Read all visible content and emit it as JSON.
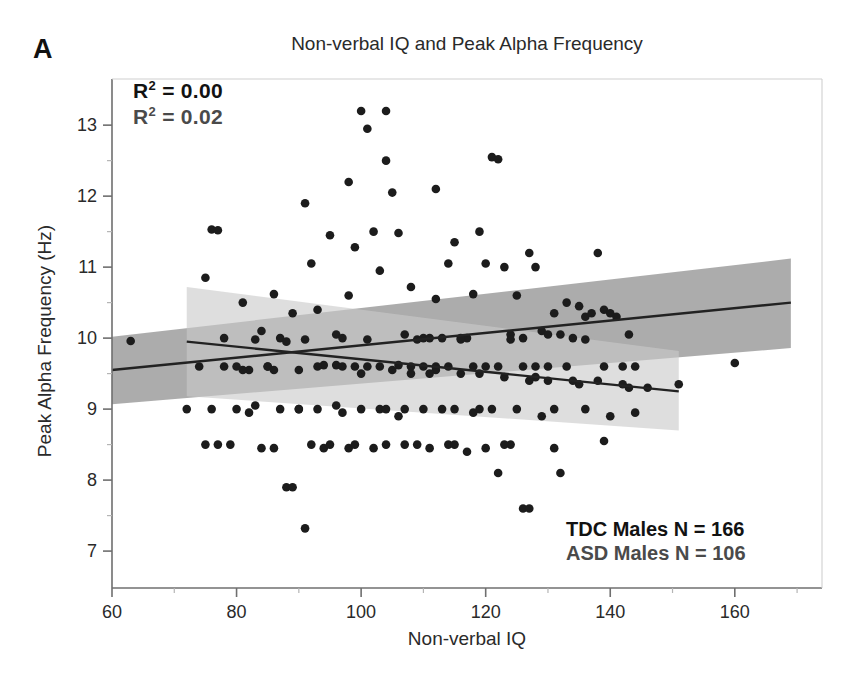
{
  "figure": {
    "panel_letter": "A",
    "title": "Non-verbal IQ and Peak Alpha Frequency",
    "xlabel": "Non-verbal IQ",
    "ylabel": "Peak Alpha Frequency (Hz)"
  },
  "annotations": {
    "r2_tdc_label": "R",
    "r2_tdc_value": " = 0.00",
    "r2_asd_label": "R",
    "r2_asd_value": " = 0.02",
    "r2_sup": "2",
    "n_tdc": "TDC Males N = 166",
    "n_asd": "ASD Males N = 106"
  },
  "colors": {
    "point": "#1c1c1c",
    "line": "#222222",
    "band_tdc": "#a8a8a8",
    "band_asd": "#c9c9c9",
    "axis": "#8a8a8a",
    "text": "#2a2a2a"
  },
  "chart_data": {
    "type": "scatter",
    "title": "Non-verbal IQ and Peak Alpha Frequency",
    "xlabel": "Non-verbal IQ",
    "ylabel": "Peak Alpha Frequency (Hz)",
    "xlim": [
      60,
      174
    ],
    "ylim": [
      6.48,
      13.65
    ],
    "xticks": [
      60,
      80,
      100,
      120,
      140,
      160
    ],
    "yticks": [
      7,
      8,
      9,
      10,
      11,
      12,
      13
    ],
    "yminorticks": [
      7.5,
      8.5,
      9.5,
      10.5,
      11.5,
      12.5
    ],
    "grid": false,
    "legend_position": "bottom-right",
    "series": [
      {
        "name": "TDC Males",
        "n": 166,
        "r_squared": 0.0,
        "fit": {
          "x0": 60,
          "y0": 9.55,
          "x1": 169,
          "y1": 10.5
        },
        "band": {
          "x0": 60,
          "x1": 169,
          "lo0": 9.07,
          "hi0": 10.02,
          "lo1": 9.86,
          "hi1": 11.12
        }
      },
      {
        "name": "ASD Males",
        "n": 106,
        "r_squared": 0.02,
        "fit": {
          "x0": 72,
          "y0": 9.95,
          "x1": 151,
          "y1": 9.25
        },
        "band": {
          "x0": 72,
          "x1": 151,
          "lo0": 9.18,
          "hi0": 10.72,
          "lo1": 8.7,
          "hi1": 9.82
        }
      }
    ],
    "points_tdc": [
      [
        63,
        9.96
      ],
      [
        76,
        11.53
      ],
      [
        77,
        11.52
      ],
      [
        75,
        10.85
      ],
      [
        78,
        10.0
      ],
      [
        81,
        10.5
      ],
      [
        84,
        10.1
      ],
      [
        86,
        10.62
      ],
      [
        87,
        10.0
      ],
      [
        88,
        9.95
      ],
      [
        89,
        10.35
      ],
      [
        90,
        9.0
      ],
      [
        91,
        11.9
      ],
      [
        92,
        11.05
      ],
      [
        93,
        10.4
      ],
      [
        94,
        9.62
      ],
      [
        95,
        11.45
      ],
      [
        96,
        10.05
      ],
      [
        97,
        10.0
      ],
      [
        98,
        10.6
      ],
      [
        99,
        11.28
      ],
      [
        100,
        13.2
      ],
      [
        101,
        12.95
      ],
      [
        102,
        11.5
      ],
      [
        103,
        10.95
      ],
      [
        104,
        13.2
      ],
      [
        105,
        12.05
      ],
      [
        106,
        11.48
      ],
      [
        107,
        10.05
      ],
      [
        108,
        10.72
      ],
      [
        109,
        9.98
      ],
      [
        110,
        10.0
      ],
      [
        111,
        10.0
      ],
      [
        112,
        10.55
      ],
      [
        113,
        10.0
      ],
      [
        114,
        11.05
      ],
      [
        115,
        11.35
      ],
      [
        116,
        10.0
      ],
      [
        117,
        10.0
      ],
      [
        118,
        10.62
      ],
      [
        119,
        11.5
      ],
      [
        120,
        11.05
      ],
      [
        121,
        12.55
      ],
      [
        122,
        12.52
      ],
      [
        123,
        11.0
      ],
      [
        124,
        10.05
      ],
      [
        125,
        10.6
      ],
      [
        126,
        10.0
      ],
      [
        127,
        11.2
      ],
      [
        128,
        11.0
      ],
      [
        129,
        10.1
      ],
      [
        130,
        10.05
      ],
      [
        131,
        10.35
      ],
      [
        132,
        10.05
      ],
      [
        133,
        10.5
      ],
      [
        134,
        10.0
      ],
      [
        135,
        10.45
      ],
      [
        136,
        10.3
      ],
      [
        137,
        10.35
      ],
      [
        138,
        11.2
      ],
      [
        139,
        10.4
      ],
      [
        140,
        10.35
      ],
      [
        141,
        10.3
      ],
      [
        143,
        10.05
      ],
      [
        144,
        9.6
      ],
      [
        160,
        9.65
      ],
      [
        80,
        9.6
      ],
      [
        82,
        9.55
      ],
      [
        83,
        9.98
      ],
      [
        85,
        9.6
      ],
      [
        91,
        9.98
      ],
      [
        96,
        9.62
      ],
      [
        99,
        9.6
      ],
      [
        101,
        9.98
      ],
      [
        103,
        9.6
      ],
      [
        106,
        9.62
      ],
      [
        108,
        9.6
      ],
      [
        110,
        9.6
      ],
      [
        112,
        9.6
      ],
      [
        114,
        9.6
      ],
      [
        116,
        9.98
      ],
      [
        118,
        9.6
      ],
      [
        120,
        9.6
      ],
      [
        122,
        9.6
      ],
      [
        124,
        9.98
      ],
      [
        126,
        9.6
      ],
      [
        128,
        9.6
      ],
      [
        130,
        9.6
      ],
      [
        133,
        9.6
      ],
      [
        136,
        9.98
      ],
      [
        139,
        9.6
      ],
      [
        142,
        9.6
      ],
      [
        98,
        12.2
      ],
      [
        104,
        12.5
      ],
      [
        112,
        12.1
      ]
    ],
    "points_asd": [
      [
        72,
        9.0
      ],
      [
        75,
        8.5
      ],
      [
        77,
        8.5
      ],
      [
        78,
        9.6
      ],
      [
        80,
        9.0
      ],
      [
        82,
        8.95
      ],
      [
        83,
        9.05
      ],
      [
        84,
        8.45
      ],
      [
        85,
        9.6
      ],
      [
        86,
        8.45
      ],
      [
        87,
        9.0
      ],
      [
        88,
        7.9
      ],
      [
        89,
        7.9
      ],
      [
        90,
        9.0
      ],
      [
        91,
        7.32
      ],
      [
        92,
        8.5
      ],
      [
        93,
        9.0
      ],
      [
        94,
        8.45
      ],
      [
        95,
        8.5
      ],
      [
        96,
        9.05
      ],
      [
        97,
        9.6
      ],
      [
        98,
        8.45
      ],
      [
        99,
        8.5
      ],
      [
        100,
        9.0
      ],
      [
        101,
        9.6
      ],
      [
        102,
        8.45
      ],
      [
        103,
        9.0
      ],
      [
        104,
        8.5
      ],
      [
        105,
        9.55
      ],
      [
        106,
        8.9
      ],
      [
        107,
        9.0
      ],
      [
        108,
        9.5
      ],
      [
        109,
        8.5
      ],
      [
        110,
        9.0
      ],
      [
        111,
        8.45
      ],
      [
        112,
        9.55
      ],
      [
        113,
        9.0
      ],
      [
        114,
        8.5
      ],
      [
        115,
        9.0
      ],
      [
        116,
        9.5
      ],
      [
        117,
        8.4
      ],
      [
        118,
        8.95
      ],
      [
        119,
        9.5
      ],
      [
        120,
        8.45
      ],
      [
        121,
        9.0
      ],
      [
        122,
        8.1
      ],
      [
        123,
        9.45
      ],
      [
        124,
        8.5
      ],
      [
        125,
        9.0
      ],
      [
        126,
        7.6
      ],
      [
        127,
        7.6
      ],
      [
        128,
        9.45
      ],
      [
        129,
        8.9
      ],
      [
        130,
        9.4
      ],
      [
        131,
        8.45
      ],
      [
        132,
        8.1
      ],
      [
        134,
        9.4
      ],
      [
        136,
        9.0
      ],
      [
        138,
        9.4
      ],
      [
        140,
        8.9
      ],
      [
        142,
        9.35
      ],
      [
        144,
        8.95
      ],
      [
        146,
        9.3
      ],
      [
        151,
        9.35
      ],
      [
        74,
        9.6
      ],
      [
        76,
        9.0
      ],
      [
        79,
        8.5
      ],
      [
        81,
        9.55
      ],
      [
        86,
        9.55
      ],
      [
        90,
        9.55
      ],
      [
        93,
        9.6
      ],
      [
        97,
        8.95
      ],
      [
        100,
        9.5
      ],
      [
        104,
        9.0
      ],
      [
        107,
        8.5
      ],
      [
        111,
        9.5
      ],
      [
        115,
        8.5
      ],
      [
        119,
        9.0
      ],
      [
        123,
        8.5
      ],
      [
        127,
        9.4
      ],
      [
        131,
        9.0
      ],
      [
        135,
        9.35
      ],
      [
        139,
        8.55
      ],
      [
        143,
        9.3
      ]
    ]
  }
}
